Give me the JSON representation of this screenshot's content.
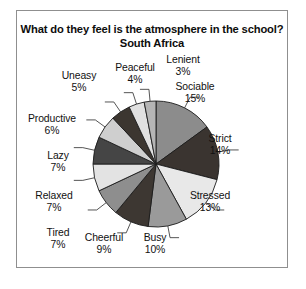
{
  "figure": {
    "title_line1": "What do they feel is the atmosphere in the school?",
    "title_line2": "South Africa",
    "border_color": "#8f8f8f",
    "background": "#ffffff"
  },
  "chart_data": {
    "type": "pie",
    "title": "What do they feel is the atmosphere in the school? South Africa",
    "subtitle": "South Africa",
    "xlabel": "",
    "ylabel": "",
    "legend": "none",
    "grid": false,
    "start_angle_deg": 0,
    "direction": "clockwise",
    "units": "percent",
    "total": 100,
    "categories": [
      "Sociable",
      "Strict",
      "Stressed",
      "Busy",
      "Cheerful",
      "Tired",
      "Relaxed",
      "Lazy",
      "Productive",
      "Uneasy",
      "Peaceful",
      "Lenient"
    ],
    "values": [
      15,
      14,
      13,
      10,
      9,
      7,
      7,
      7,
      6,
      5,
      4,
      3
    ],
    "slices": [
      {
        "label": "Sociable",
        "pct_text": "15%",
        "value": 15,
        "color": "#8c8c8c",
        "label_x": 178,
        "label_y": 76
      },
      {
        "label": "Strict",
        "pct_text": "14%",
        "value": 14,
        "color": "#3a3430",
        "label_x": 203,
        "label_y": 128
      },
      {
        "label": "Stressed",
        "pct_text": "13%",
        "value": 13,
        "color": "#e8e8e8",
        "label_x": 193,
        "label_y": 185
      },
      {
        "label": "Busy",
        "pct_text": "10%",
        "value": 10,
        "color": "#9a9a9a",
        "label_x": 138,
        "label_y": 227
      },
      {
        "label": "Cheerful",
        "pct_text": "9%",
        "value": 9,
        "color": "#3d3732",
        "label_x": 87,
        "label_y": 227
      },
      {
        "label": "Tired",
        "pct_text": "7%",
        "value": 7,
        "color": "#8e8e8e",
        "label_x": 41,
        "label_y": 222
      },
      {
        "label": "Relaxed",
        "pct_text": "7%",
        "value": 7,
        "color": "#e3e3e3",
        "label_x": 37,
        "label_y": 185
      },
      {
        "label": "Lazy",
        "pct_text": "7%",
        "value": 7,
        "color": "#454545",
        "label_x": 41,
        "label_y": 145
      },
      {
        "label": "Productive",
        "pct_text": "6%",
        "value": 6,
        "color": "#cfcfcf",
        "label_x": 35,
        "label_y": 108
      },
      {
        "label": "Uneasy",
        "pct_text": "5%",
        "value": 5,
        "color": "#3c3630",
        "label_x": 62,
        "label_y": 65
      },
      {
        "label": "Peaceful",
        "pct_text": "4%",
        "value": 4,
        "color": "#e0e0e0",
        "label_x": 118,
        "label_y": 57
      },
      {
        "label": "Lenient",
        "pct_text": "3%",
        "value": 3,
        "color": "#b5b5b5",
        "label_x": 166,
        "label_y": 49
      }
    ],
    "geometry": {
      "center_x": 139,
      "center_y": 153,
      "radius": 63
    }
  }
}
